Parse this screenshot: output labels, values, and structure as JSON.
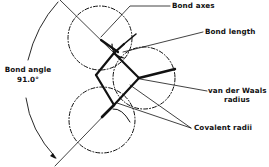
{
  "diagram": {
    "type": "molecular-geometry-schematic",
    "labels": {
      "bond_axes": "Bond axes",
      "bond_length": "Bond length",
      "bond_angle_title": "Bond angle",
      "bond_angle_value": "91.0°",
      "vdw_line1": "van der Waals",
      "vdw_line2": "radius",
      "covalent_radii": "Covalent radii"
    },
    "colors": {
      "ink": "#111111",
      "background": "#ffffff"
    }
  }
}
